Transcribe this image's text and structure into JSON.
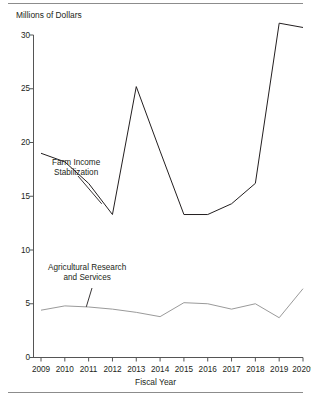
{
  "chart_data": {
    "type": "line",
    "title": "",
    "subtitle": "",
    "ylabel": "Millions of Dollars",
    "xlabel": "Fiscal Year",
    "categories": [
      "2009",
      "2010",
      "2011",
      "2012",
      "2013",
      "2014",
      "2015",
      "2016",
      "2017",
      "2018",
      "2019",
      "2020*"
    ],
    "ylim": [
      0,
      30
    ],
    "yticks": [
      0,
      5,
      10,
      15,
      20,
      25,
      30
    ],
    "xlim_note": "categorical, evenly spaced",
    "grid": false,
    "legend_position": "inline annotations",
    "series": [
      {
        "name": "Farm Income Stabilization",
        "color": "#231f20",
        "values": [
          19.0,
          18.2,
          16.2,
          13.3,
          25.2,
          19.2,
          13.3,
          13.3,
          14.3,
          16.2,
          31.1,
          30.7
        ]
      },
      {
        "name": "Agricultural Research and Services",
        "color": "#9a9a9a",
        "values": [
          4.4,
          4.8,
          4.7,
          4.5,
          4.2,
          3.8,
          5.1,
          5.0,
          4.5,
          5.0,
          3.7,
          6.4
        ]
      }
    ],
    "annotations": [
      {
        "id": "farm-income-label",
        "line1": "Farm Income",
        "line2": "Stabilization",
        "points_to_series": "Farm Income Stabilization"
      },
      {
        "id": "agricultural-research-label",
        "line1": "Agricultural Research",
        "line2": "and Services",
        "points_to_series": "Agricultural Research and Services"
      }
    ]
  },
  "axes": {
    "y_title": "Millions of Dollars",
    "x_title": "Fiscal Year",
    "y_ticks": [
      "30",
      "25",
      "20",
      "15",
      "10",
      "5",
      "0"
    ],
    "x_ticks": [
      "2009",
      "2010",
      "2011",
      "2012",
      "2013",
      "2014",
      "2015",
      "2016",
      "2017",
      "2018",
      "2019",
      "2020*"
    ]
  },
  "annotations": {
    "farm": {
      "line1": "Farm Income",
      "line2": "Stabilization"
    },
    "agri": {
      "line1": "Agricultural Research",
      "line2": "and Services"
    }
  },
  "colors": {
    "series_farm": "#231f20",
    "series_agri": "#9a9a9a",
    "axis": "#555555",
    "rule": "#8c8c8c"
  }
}
